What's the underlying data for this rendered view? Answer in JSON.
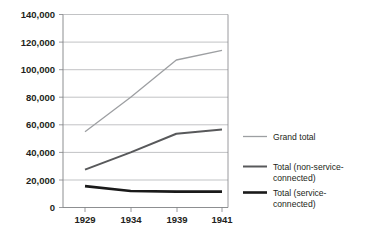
{
  "chart_data": {
    "type": "line",
    "title": "",
    "subtitle": "",
    "xlabel": "",
    "ylabel": "",
    "categories": [
      "1929",
      "1934",
      "1939",
      "1941"
    ],
    "series": [
      {
        "name": "Grand total",
        "color": "#9d9fa2",
        "values": [
          55000,
          80000,
          107000,
          114000
        ]
      },
      {
        "name": "Total (non-service-connected)",
        "color": "#58595b",
        "values": [
          27500,
          40000,
          53500,
          56500
        ]
      },
      {
        "name": "Total (service-connected)",
        "color": "#1a1a1a",
        "values": [
          15500,
          12000,
          11500,
          11500
        ]
      }
    ],
    "ylim": [
      0,
      140000
    ],
    "ytick_values": [
      0,
      20000,
      40000,
      60000,
      80000,
      100000,
      120000,
      140000
    ],
    "ytick_labels": [
      "0",
      "20,000",
      "40,000",
      "60,000",
      "80,000",
      "100,000",
      "120,000",
      "140,000"
    ],
    "grid": true,
    "grid_axis": "y",
    "legend_position": "right",
    "legend": [
      {
        "label_line1": "Grand total",
        "label_line2": "",
        "color": "#9d9fa2",
        "weight": 1.3
      },
      {
        "label_line1": "Total (non-service-",
        "label_line2": "connected)",
        "color": "#58595b",
        "weight": 2.0
      },
      {
        "label_line1": "Total (service-",
        "label_line2": "connected)",
        "color": "#1a1a1a",
        "weight": 2.6
      }
    ]
  }
}
